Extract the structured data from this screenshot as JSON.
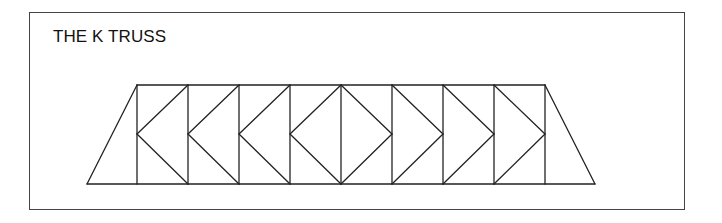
{
  "diagram": {
    "title": "THE K TRUSS",
    "type": "truss",
    "panels": 8,
    "stroke_color": "#222222",
    "geometry": {
      "top_chord_y": 85,
      "bottom_chord_y": 184,
      "mid_y": 134,
      "bottom_left_x": 87,
      "bottom_right_x": 595,
      "verticals_x": [
        137,
        188,
        239,
        290,
        341,
        392,
        443,
        494,
        545
      ]
    },
    "panel_patterns": [
      "<",
      "<",
      "<",
      "<",
      ">",
      ">",
      ">",
      ">"
    ]
  }
}
